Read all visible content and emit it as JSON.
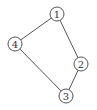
{
  "diagram": {
    "type": "undirected-graph",
    "colors": {
      "stroke": "#555555",
      "fill": "#ffffff",
      "text": "#333333"
    },
    "nodes": [
      {
        "id": "1",
        "label": "1",
        "x": 57,
        "y": 14,
        "r": 7
      },
      {
        "id": "2",
        "label": "2",
        "x": 81,
        "y": 64,
        "r": 7
      },
      {
        "id": "3",
        "label": "3",
        "x": 66,
        "y": 96,
        "r": 7
      },
      {
        "id": "4",
        "label": "4",
        "x": 15,
        "y": 44,
        "r": 7
      }
    ],
    "edges": [
      {
        "from": "1",
        "to": "4"
      },
      {
        "from": "1",
        "to": "2"
      },
      {
        "from": "2",
        "to": "3"
      },
      {
        "from": "4",
        "to": "3"
      }
    ]
  }
}
